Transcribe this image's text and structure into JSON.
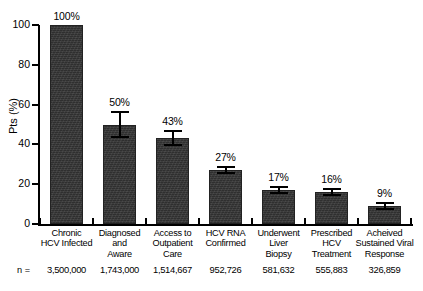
{
  "chart_data": {
    "type": "bar",
    "title": "",
    "subtitle": "",
    "xlabel": "",
    "ylabel": "Pts (%)",
    "ylim": [
      0,
      100
    ],
    "yticks": [
      0,
      20,
      40,
      60,
      80,
      100
    ],
    "ytick_labels": [
      "0",
      "20",
      "40",
      "60",
      "80",
      "100"
    ],
    "grid": false,
    "legend": false,
    "legend_position": "none",
    "categories": [
      "Chronic HCV Infected",
      "Diagnosed and Aware",
      "Access to Outpatient Care",
      "HCV RNA Confirmed",
      "Underwent Liver Biopsy",
      "Prescribed HCV Treatment",
      "Acheived Sustained Viral Response"
    ],
    "category_lines": [
      [
        "Chronic",
        "HCV Infected"
      ],
      [
        "Diagnosed",
        "and",
        "Aware"
      ],
      [
        "Access to",
        "Outpatient",
        "Care"
      ],
      [
        "HCV RNA",
        "Confirmed"
      ],
      [
        "Underwent",
        "Liver",
        "Biopsy"
      ],
      [
        "Prescribed",
        "HCV",
        "Treatment"
      ],
      [
        "Acheived",
        "Sustained Viral",
        "Response"
      ]
    ],
    "values": [
      100,
      50,
      43,
      27,
      17,
      16,
      9
    ],
    "value_labels": [
      "100%",
      "50%",
      "43%",
      "27%",
      "17%",
      "16%",
      "9%"
    ],
    "errors": [
      0,
      7,
      4,
      2,
      2,
      2,
      2
    ],
    "n_prefix": "n =",
    "n_values": [
      "3,500,000",
      "1,743,000",
      "1,514,667",
      "952,726",
      "581,632",
      "555,883",
      "326,859"
    ],
    "bar_color": "#383838",
    "axis_color": "#000000",
    "background_color": "#ffffff"
  }
}
